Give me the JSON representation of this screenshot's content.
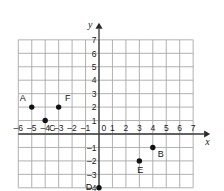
{
  "chart_data": {
    "type": "scatter",
    "title": "",
    "xlabel": "x",
    "ylabel": "y",
    "xlim": [
      -6,
      7
    ],
    "ylim": [
      -4,
      7
    ],
    "grid": true,
    "legend": "none",
    "x_ticks": [
      "-6",
      "-5",
      "-4",
      "-3",
      "-2",
      "-1",
      "1",
      "2",
      "3",
      "4",
      "5",
      "6",
      "7"
    ],
    "y_ticks": [
      "7",
      "6",
      "5",
      "4",
      "3",
      "2",
      "1",
      "-1",
      "-2",
      "-3",
      "-4"
    ],
    "origin_label": "0",
    "points": [
      {
        "label": "A",
        "x": -5,
        "y": 2,
        "label_dx": -9,
        "label_dy": -6
      },
      {
        "label": "F",
        "x": -3,
        "y": 2,
        "label_dx": 9,
        "label_dy": -6
      },
      {
        "label": "C",
        "x": -4,
        "y": 1,
        "label_dx": 7,
        "label_dy": 10
      },
      {
        "label": "B",
        "x": 4,
        "y": -1,
        "label_dx": 8,
        "label_dy": 10
      },
      {
        "label": "E",
        "x": 3,
        "y": -2,
        "label_dx": 1,
        "label_dy": 12
      },
      {
        "label": "D",
        "x": 0,
        "y": -4,
        "label_dx": -10,
        "label_dy": 2
      }
    ]
  },
  "colors": {
    "grid": "#a8a8a8",
    "axis": "#3a3a3a",
    "point": "#121212",
    "background": "#ffffff"
  }
}
